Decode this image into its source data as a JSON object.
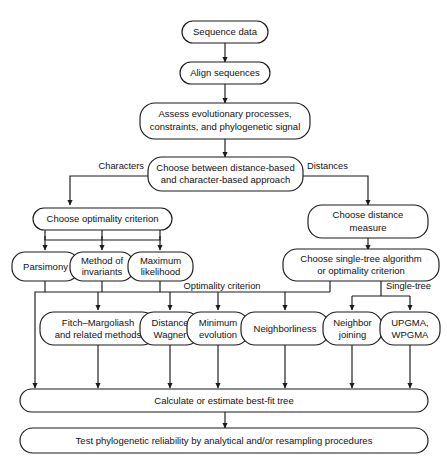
{
  "diagram": {
    "background_color": "#ffffff",
    "line_color": "#1a1a1a",
    "text_color": "#111111",
    "nodes": {
      "sequence_data": "Sequence data",
      "align_sequences": "Align sequences",
      "assess_line1": "Assess evolutionary processes,",
      "assess_line2": "constraints, and phylogenetic signal",
      "choose_approach_line1": "Choose between distance-based",
      "choose_approach_line2": "and character-based approach",
      "choose_optimality": "Choose optimality criterion",
      "choose_distance_line1": "Choose distance",
      "choose_distance_line2": "measure",
      "parsimony": "Parsimony",
      "method_invariants_line1": "Method of",
      "method_invariants_line2": "invariants",
      "maximum_likelihood_line1": "Maximum",
      "maximum_likelihood_line2": "likelihood",
      "choose_single_tree_line1": "Choose single-tree algorithm",
      "choose_single_tree_line2": "or optimality criterion",
      "fitch_margoliash_line1": "Fitch–Margoliash",
      "fitch_margoliash_line2": "and related methods",
      "distance_wagner_line1": "Distance",
      "distance_wagner_line2": "Wagner",
      "minimum_evolution_line1": "Minimum",
      "minimum_evolution_line2": "evolution",
      "neighborliness": "Neighborliness",
      "neighbor_joining_line1": "Neighbor",
      "neighbor_joining_line2": "joining",
      "upgma_line1": "UPGMA,",
      "upgma_line2": "WPGMA",
      "calculate_tree": "Calculate or estimate best-fit tree",
      "test_reliability": "Test phylogenetic reliability by analytical and/or resampling procedures"
    },
    "edge_labels": {
      "characters": "Characters",
      "distances": "Distances",
      "optimality_criterion": "Optimality criterion",
      "single_tree": "Single-tree"
    }
  }
}
